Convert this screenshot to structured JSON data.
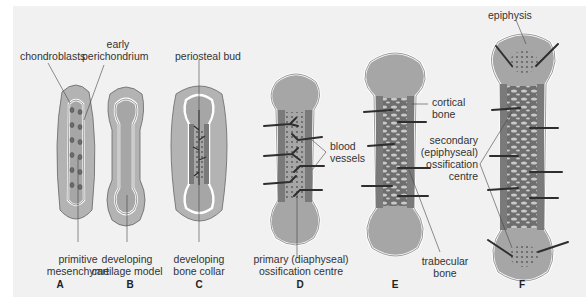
{
  "figure": {
    "colors": {
      "background": "#f1f1f1",
      "mesenchyme": "#b3b3b3",
      "cartilage": "#a6a6a6",
      "perichondrium_line": "#ffffff",
      "outline": "#555555",
      "bone_collar": "#7a7a7a",
      "vessel": "#2e2e2e",
      "trabecular_bone": "#6e6e6e",
      "marrow_space": "#c9c9c9"
    },
    "stages": [
      {
        "letter": "A",
        "caption_line1": "primitive",
        "caption_line2": "mesenchyme"
      },
      {
        "letter": "B",
        "caption_line1": "developing",
        "caption_line2": "cartilage model"
      },
      {
        "letter": "C",
        "caption_line1": "developing",
        "caption_line2": "bone collar"
      },
      {
        "letter": "D",
        "caption_line1": "primary (diaphyseal)",
        "caption_line2": "ossification centre"
      },
      {
        "letter": "E",
        "caption_line1": "trabecular",
        "caption_line2": "bone"
      },
      {
        "letter": "F",
        "caption_line1": "",
        "caption_line2": ""
      }
    ],
    "callouts": {
      "chondroblasts": "chondroblasts",
      "early_perichondrium_1": "early",
      "early_perichondrium_2": "perichondrium",
      "periosteal_bud": "periosteal bud",
      "blood_vessels_1": "blood",
      "blood_vessels_2": "vessels",
      "cortical_bone_1": "cortical",
      "cortical_bone_2": "bone",
      "secondary_1": "secondary",
      "secondary_2": "(epiphyseal)",
      "secondary_3": "ossification",
      "secondary_4": "centre",
      "epiphysis": "epiphysis"
    }
  }
}
